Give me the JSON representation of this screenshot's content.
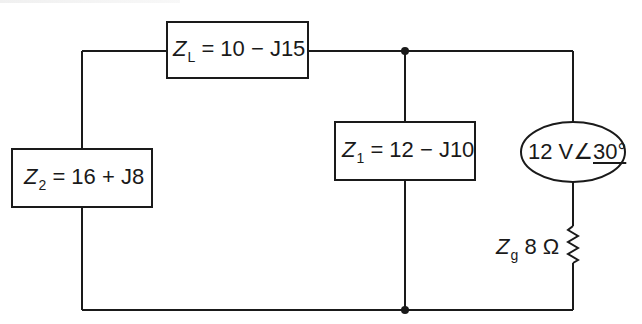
{
  "diagram": {
    "type": "ac-circuit",
    "components": {
      "z_l": {
        "symbol": "Z",
        "subscript": "L",
        "expression": "= 10 − J15"
      },
      "z_1": {
        "symbol": "Z",
        "subscript": "1",
        "expression": "= 12 − J10"
      },
      "z_2": {
        "symbol": "Z",
        "subscript": "2",
        "expression": "= 16 + J8"
      },
      "source": {
        "magnitude": "12 V",
        "angle": "30°"
      },
      "z_g": {
        "symbol": "Z",
        "subscript": "g",
        "value": "8 Ω"
      }
    },
    "colors": {
      "line": "#1a1a1a",
      "background": "#ffffff"
    }
  }
}
